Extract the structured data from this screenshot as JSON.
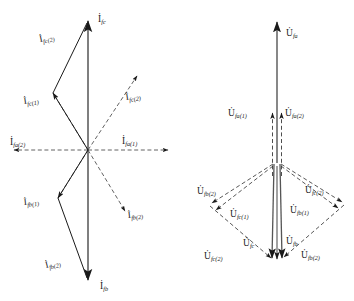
{
  "figure": {
    "background_color": "#ffffff",
    "stroke_color": "#1a1a1a",
    "panels": [
      {
        "id": "current-phasor-diagram",
        "name": "current-diagram",
        "quantity_symbol": "I",
        "origin": {
          "x": 88,
          "y": 150
        },
        "labels": [
          {
            "key": "i_fc",
            "base": "I",
            "sub": "fc",
            "text": "İ_fc",
            "x": 98,
            "y": 22,
            "style": "solid"
          },
          {
            "key": "i_fc2_up",
            "base": "I",
            "sub": "fc(2)",
            "text": "İ_fc(2)",
            "x": 40,
            "y": 42,
            "style": "solid"
          },
          {
            "key": "i_fc1",
            "base": "I",
            "sub": "fc(1)",
            "text": "İ_fc(1)",
            "x": 28,
            "y": 104,
            "style": "solid"
          },
          {
            "key": "i_fc2_dd",
            "base": "I",
            "sub": "fc(2)",
            "text": "İ_fc(2)",
            "x": 126,
            "y": 100,
            "style": "dashed"
          },
          {
            "key": "i_fa2",
            "base": "I",
            "sub": "fa(2)",
            "text": "İ_fa(2)",
            "x": 10,
            "y": 145,
            "style": "dashed"
          },
          {
            "key": "i_fa1",
            "base": "I",
            "sub": "fa(1)",
            "text": "İ_fa(1)",
            "x": 124,
            "y": 143,
            "style": "dashed"
          },
          {
            "key": "i_fb1",
            "base": "I",
            "sub": "fb(1)",
            "text": "İ_fb(1)",
            "x": 26,
            "y": 205,
            "style": "solid"
          },
          {
            "key": "i_fb2_dd",
            "base": "I",
            "sub": "fb(2)",
            "text": "İ_fb(2)",
            "x": 126,
            "y": 217,
            "style": "dashed"
          },
          {
            "key": "i_fb2_lo",
            "base": "I",
            "sub": "fb(2)",
            "text": "İ_fb(2)",
            "x": 48,
            "y": 268,
            "style": "solid"
          },
          {
            "key": "i_fb",
            "base": "I",
            "sub": "fb",
            "text": "İ_fb",
            "x": 102,
            "y": 288,
            "style": "solid"
          }
        ]
      },
      {
        "id": "voltage-phasor-diagram",
        "name": "voltage-diagram",
        "quantity_symbol": "U",
        "origin": {
          "x": 277,
          "y": 163
        },
        "labels": [
          {
            "key": "u_fa",
            "base": "U",
            "sub": "fa",
            "text": "U̇_fa",
            "x": 286,
            "y": 36,
            "style": "solid"
          },
          {
            "key": "u_fa1",
            "base": "U",
            "sub": "fa(1)",
            "text": "U̇_fa(1)",
            "x": 231,
            "y": 115,
            "style": "dashed"
          },
          {
            "key": "u_fa2",
            "base": "U",
            "sub": "fa(2)",
            "text": "U̇_fa(2)",
            "x": 285,
            "y": 115,
            "style": "dashed"
          },
          {
            "key": "u_fb2_ul",
            "base": "U",
            "sub": "fb(2)",
            "text": "U̇_fb(2)",
            "x": 199,
            "y": 193,
            "style": "dashed"
          },
          {
            "key": "u_fc2_ur",
            "base": "U",
            "sub": "fc(2)",
            "text": "U̇_fc(2)",
            "x": 307,
            "y": 192,
            "style": "dashed"
          },
          {
            "key": "u_fc1",
            "base": "U",
            "sub": "fc(1)",
            "text": "U̇_fc(1)",
            "x": 232,
            "y": 216,
            "style": "dashed"
          },
          {
            "key": "u_fb1",
            "base": "U",
            "sub": "fb(1)",
            "text": "U̇_fb(1)",
            "x": 292,
            "y": 212,
            "style": "dashed"
          },
          {
            "key": "u_fc",
            "base": "U",
            "sub": "fc",
            "text": "U̇_fc",
            "x": 245,
            "y": 245,
            "style": "solid"
          },
          {
            "key": "u_fb",
            "base": "U",
            "sub": "fb",
            "text": "U̇_fb",
            "x": 276,
            "y": 243,
            "style": "solid"
          },
          {
            "key": "u_fc2_lo",
            "base": "U",
            "sub": "fc(2)",
            "text": "U̇_fc(2)",
            "x": 206,
            "y": 258,
            "style": "dashed"
          },
          {
            "key": "u_fb2_lo",
            "base": "U",
            "sub": "fb(2)",
            "text": "U̇_fb(2)",
            "x": 303,
            "y": 257,
            "style": "dashed"
          }
        ]
      }
    ]
  }
}
